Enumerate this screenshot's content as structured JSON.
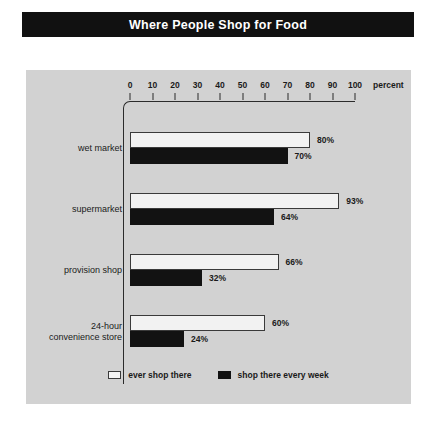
{
  "title": "Where People Shop for Food",
  "axis": {
    "percent_label": "percent",
    "ticks": [
      0,
      10,
      20,
      30,
      40,
      50,
      60,
      70,
      80,
      90,
      100
    ]
  },
  "legend": [
    {
      "key": "light",
      "label": "ever shop there"
    },
    {
      "key": "dark",
      "label": "shop there every week"
    }
  ],
  "colors": {
    "page_background": "#ffffff",
    "panel_background": "#d2d2d2",
    "title_bar": "#111111",
    "title_text": "#ffffff",
    "bar_light": "#f2f2f2",
    "bar_dark": "#121212",
    "axis": "#2b2b2b",
    "text": "#1a1a1a"
  },
  "chart_data": {
    "type": "bar",
    "title": "Where People Shop for Food",
    "xlabel": "percent",
    "ylabel": "",
    "xlim": [
      0,
      100
    ],
    "xticks": [
      0,
      10,
      20,
      30,
      40,
      50,
      60,
      70,
      80,
      90,
      100
    ],
    "grid": false,
    "orientation": "horizontal",
    "legend_position": "bottom-center",
    "categories": [
      "wet market",
      "supermarket",
      "provision shop",
      "24-hour\nconvenience store"
    ],
    "series": [
      {
        "name": "ever shop there",
        "color": "#f2f2f2",
        "values": [
          80,
          93,
          66,
          60
        ],
        "labels": [
          "80%",
          "93%",
          "66%",
          "60%"
        ]
      },
      {
        "name": "shop there every week",
        "color": "#121212",
        "values": [
          70,
          64,
          32,
          24
        ],
        "labels": [
          "70%",
          "64%",
          "32%",
          "24%"
        ]
      }
    ]
  }
}
